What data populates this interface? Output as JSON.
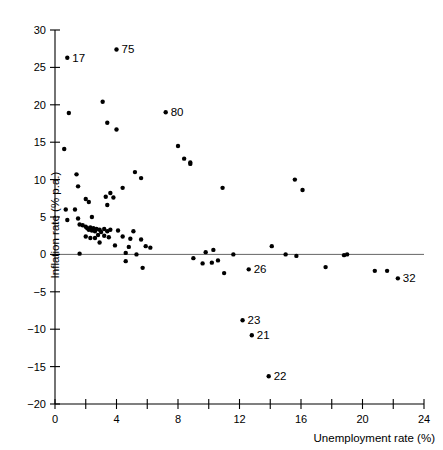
{
  "chart_data": {
    "type": "scatter",
    "title": "",
    "xlabel": "Unemployment rate (%)",
    "ylabel": "Inflation rate (% p.a.)",
    "xlim": [
      0,
      24
    ],
    "ylim": [
      -20,
      30
    ],
    "x_tick_step": 2,
    "x_label_step": 4,
    "y_tick_step": 5,
    "xticks": [
      0,
      2,
      4,
      6,
      8,
      10,
      12,
      14,
      16,
      18,
      20,
      22,
      24
    ],
    "xtick_labels": [
      "0",
      "",
      "4",
      "",
      "8",
      "",
      "12",
      "",
      "16",
      "",
      "20",
      "",
      "24"
    ],
    "yticks": [
      -20,
      -15,
      -10,
      -5,
      0,
      5,
      10,
      15,
      20,
      25,
      30
    ],
    "ytick_labels": [
      "−20",
      "−15",
      "−10",
      "−5",
      "0",
      "5",
      "10",
      "15",
      "20",
      "25",
      "30"
    ],
    "grid": false,
    "legend": null,
    "zero_reference_line": 0,
    "marker_color": "#000000",
    "marker_size": 2.2,
    "points": [
      {
        "x": 0.8,
        "y": 26.3,
        "label": "17"
      },
      {
        "x": 4.0,
        "y": 27.4,
        "label": "75"
      },
      {
        "x": 7.2,
        "y": 19.0,
        "label": "80"
      },
      {
        "x": 12.2,
        "y": -8.8,
        "label": "23"
      },
      {
        "x": 12.8,
        "y": -10.8,
        "label": "21"
      },
      {
        "x": 13.9,
        "y": -16.3,
        "label": "22"
      },
      {
        "x": 22.3,
        "y": -3.2,
        "label": "32"
      },
      {
        "x": 12.6,
        "y": -2.0,
        "label": "26"
      },
      {
        "x": 0.9,
        "y": 18.9,
        "label": ""
      },
      {
        "x": 3.1,
        "y": 20.4,
        "label": ""
      },
      {
        "x": 3.4,
        "y": 17.6,
        "label": ""
      },
      {
        "x": 4.0,
        "y": 16.7,
        "label": ""
      },
      {
        "x": 0.6,
        "y": 14.1,
        "label": ""
      },
      {
        "x": 8.0,
        "y": 14.5,
        "label": ""
      },
      {
        "x": 8.4,
        "y": 12.8,
        "label": ""
      },
      {
        "x": 8.8,
        "y": 12.3,
        "label": ""
      },
      {
        "x": 8.8,
        "y": 12.1,
        "label": ""
      },
      {
        "x": 1.4,
        "y": 10.7,
        "label": ""
      },
      {
        "x": 5.2,
        "y": 11.0,
        "label": ""
      },
      {
        "x": 5.6,
        "y": 10.2,
        "label": ""
      },
      {
        "x": 1.5,
        "y": 9.1,
        "label": ""
      },
      {
        "x": 4.4,
        "y": 8.9,
        "label": ""
      },
      {
        "x": 10.9,
        "y": 8.9,
        "label": ""
      },
      {
        "x": 15.6,
        "y": 10.0,
        "label": ""
      },
      {
        "x": 16.1,
        "y": 8.6,
        "label": ""
      },
      {
        "x": 2.0,
        "y": 7.4,
        "label": ""
      },
      {
        "x": 2.2,
        "y": 7.0,
        "label": ""
      },
      {
        "x": 3.6,
        "y": 8.2,
        "label": ""
      },
      {
        "x": 3.8,
        "y": 7.6,
        "label": ""
      },
      {
        "x": 3.3,
        "y": 7.7,
        "label": ""
      },
      {
        "x": 3.4,
        "y": 6.6,
        "label": ""
      },
      {
        "x": 0.7,
        "y": 6.0,
        "label": ""
      },
      {
        "x": 1.3,
        "y": 6.0,
        "label": ""
      },
      {
        "x": 0.8,
        "y": 4.6,
        "label": ""
      },
      {
        "x": 1.5,
        "y": 4.8,
        "label": ""
      },
      {
        "x": 2.4,
        "y": 5.0,
        "label": ""
      },
      {
        "x": 1.6,
        "y": 4.0,
        "label": ""
      },
      {
        "x": 1.8,
        "y": 3.9,
        "label": ""
      },
      {
        "x": 2.0,
        "y": 3.7,
        "label": ""
      },
      {
        "x": 2.1,
        "y": 3.5,
        "label": ""
      },
      {
        "x": 2.2,
        "y": 3.3,
        "label": ""
      },
      {
        "x": 2.3,
        "y": 3.6,
        "label": ""
      },
      {
        "x": 2.4,
        "y": 3.2,
        "label": ""
      },
      {
        "x": 2.5,
        "y": 3.5,
        "label": ""
      },
      {
        "x": 2.6,
        "y": 3.1,
        "label": ""
      },
      {
        "x": 2.7,
        "y": 3.4,
        "label": ""
      },
      {
        "x": 2.9,
        "y": 3.3,
        "label": ""
      },
      {
        "x": 3.0,
        "y": 3.0,
        "label": ""
      },
      {
        "x": 3.2,
        "y": 3.4,
        "label": ""
      },
      {
        "x": 3.4,
        "y": 3.1,
        "label": ""
      },
      {
        "x": 3.6,
        "y": 3.3,
        "label": ""
      },
      {
        "x": 4.1,
        "y": 3.2,
        "label": ""
      },
      {
        "x": 5.1,
        "y": 3.1,
        "label": ""
      },
      {
        "x": 2.0,
        "y": 2.4,
        "label": ""
      },
      {
        "x": 2.3,
        "y": 2.2,
        "label": ""
      },
      {
        "x": 2.6,
        "y": 2.2,
        "label": ""
      },
      {
        "x": 2.8,
        "y": 2.6,
        "label": ""
      },
      {
        "x": 3.2,
        "y": 2.5,
        "label": ""
      },
      {
        "x": 3.5,
        "y": 2.3,
        "label": ""
      },
      {
        "x": 4.4,
        "y": 2.4,
        "label": ""
      },
      {
        "x": 4.9,
        "y": 2.1,
        "label": ""
      },
      {
        "x": 5.6,
        "y": 2.0,
        "label": ""
      },
      {
        "x": 2.9,
        "y": 1.6,
        "label": ""
      },
      {
        "x": 3.9,
        "y": 1.2,
        "label": ""
      },
      {
        "x": 4.8,
        "y": 1.0,
        "label": ""
      },
      {
        "x": 5.9,
        "y": 1.1,
        "label": ""
      },
      {
        "x": 6.2,
        "y": 0.9,
        "label": ""
      },
      {
        "x": 1.6,
        "y": 0.1,
        "label": ""
      },
      {
        "x": 4.6,
        "y": 0.2,
        "label": ""
      },
      {
        "x": 5.3,
        "y": 0.0,
        "label": ""
      },
      {
        "x": 9.8,
        "y": 0.3,
        "label": ""
      },
      {
        "x": 10.3,
        "y": 0.6,
        "label": ""
      },
      {
        "x": 11.6,
        "y": 0.0,
        "label": ""
      },
      {
        "x": 14.1,
        "y": 1.1,
        "label": ""
      },
      {
        "x": 15.0,
        "y": 0.0,
        "label": ""
      },
      {
        "x": 15.7,
        "y": -0.2,
        "label": ""
      },
      {
        "x": 18.8,
        "y": -0.1,
        "label": ""
      },
      {
        "x": 19.0,
        "y": 0.0,
        "label": ""
      },
      {
        "x": 20.8,
        "y": -2.2,
        "label": ""
      },
      {
        "x": 4.6,
        "y": -0.9,
        "label": ""
      },
      {
        "x": 5.7,
        "y": -1.8,
        "label": ""
      },
      {
        "x": 9.0,
        "y": -0.5,
        "label": ""
      },
      {
        "x": 9.6,
        "y": -1.2,
        "label": ""
      },
      {
        "x": 10.2,
        "y": -1.1,
        "label": ""
      },
      {
        "x": 10.6,
        "y": -0.8,
        "label": ""
      },
      {
        "x": 11.0,
        "y": -2.5,
        "label": ""
      },
      {
        "x": 17.6,
        "y": -1.7,
        "label": ""
      },
      {
        "x": 21.6,
        "y": -2.2,
        "label": ""
      }
    ]
  }
}
